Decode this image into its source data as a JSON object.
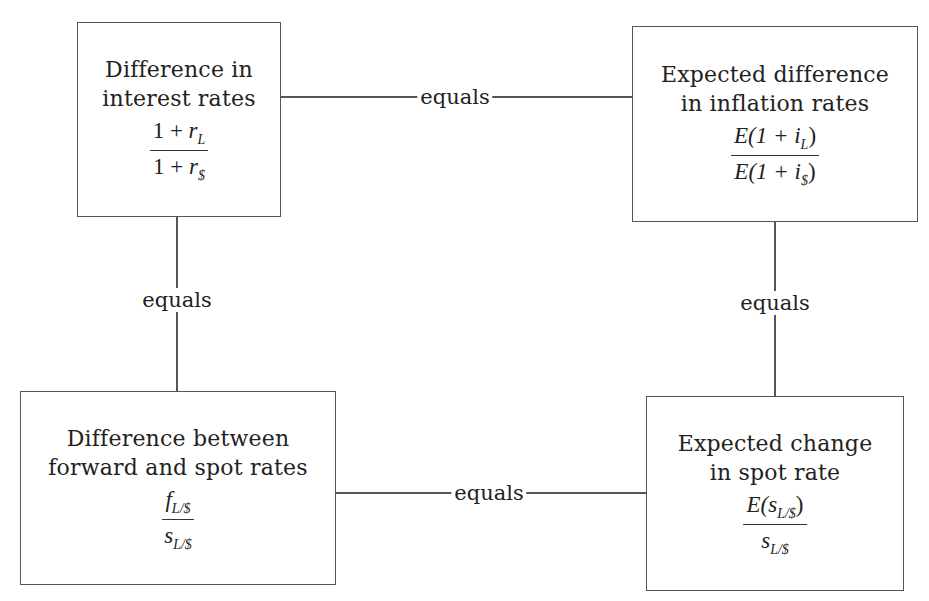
{
  "diagram": {
    "type": "parity-relationship-diagram",
    "boxes": {
      "top_left": {
        "title_line1": "Difference in",
        "title_line2": "interest rates",
        "numerator": {
          "prefix": "1 + ",
          "var": "r",
          "sub": "L",
          "suffix": ""
        },
        "denominator": {
          "prefix": "1 + ",
          "var": "r",
          "sub": "$",
          "suffix": ""
        }
      },
      "top_right": {
        "title_line1": "Expected difference",
        "title_line2": "in inflation rates",
        "numerator": {
          "prefix": "E(1 + ",
          "var": "i",
          "sub": "L",
          "suffix": ")"
        },
        "denominator": {
          "prefix": "E(1 + ",
          "var": "i",
          "sub": "$",
          "suffix": ")"
        }
      },
      "bottom_left": {
        "title_line1": "Difference between",
        "title_line2": "forward and spot rates",
        "numerator": {
          "prefix": "",
          "var": "f",
          "sub": "L/$",
          "suffix": ""
        },
        "denominator": {
          "prefix": "",
          "var": "s",
          "sub": "L/$",
          "suffix": ""
        }
      },
      "bottom_right": {
        "title_line1": "Expected change",
        "title_line2": "in spot rate",
        "numerator": {
          "prefix": "E(",
          "var": "s",
          "sub": "L/$",
          "suffix": ")"
        },
        "denominator": {
          "prefix": "",
          "var": "s",
          "sub": "L/$",
          "suffix": ""
        }
      }
    },
    "connectors": {
      "top": {
        "label": "equals",
        "from": "top_left",
        "to": "top_right"
      },
      "left": {
        "label": "equals",
        "from": "top_left",
        "to": "bottom_left"
      },
      "right": {
        "label": "equals",
        "from": "top_right",
        "to": "bottom_right"
      },
      "bottom": {
        "label": "equals",
        "from": "bottom_left",
        "to": "bottom_right"
      }
    },
    "colors": {
      "border": "#555555",
      "text": "#222222",
      "background": "#ffffff"
    }
  }
}
